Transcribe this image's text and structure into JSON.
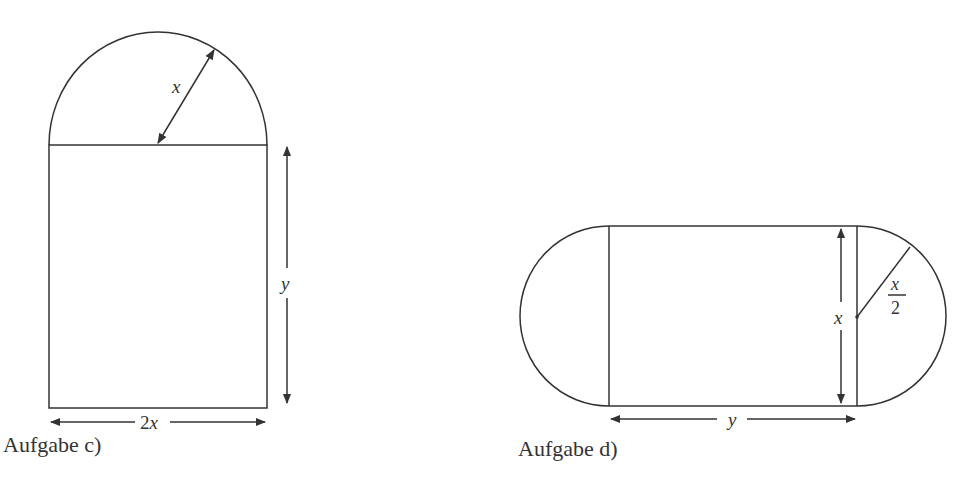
{
  "figures": [
    {
      "id": "c",
      "caption": "Aufgabe c)",
      "shape": "rectangle with semicircle on top",
      "labels": {
        "radius": "x",
        "height": "y",
        "width": "2x"
      }
    },
    {
      "id": "d",
      "caption": "Aufgabe d)",
      "shape": "rectangle with semicircles on both short sides",
      "labels": {
        "height": "x",
        "radius_num": "x",
        "radius_den": "2",
        "width": "y"
      }
    }
  ],
  "colors": {
    "stroke": "#333333",
    "background": "#ffffff"
  }
}
